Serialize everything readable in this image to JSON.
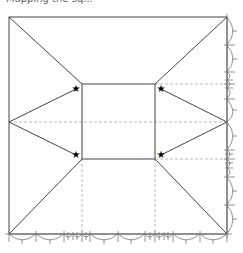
{
  "caption": "Mapping the sq...",
  "diagram": {
    "outer_square": {
      "x1": 9,
      "y1": 17,
      "x2": 227,
      "y2": 234
    },
    "inner_square": {
      "x1": 82,
      "y1": 84,
      "x2": 155,
      "y2": 159
    },
    "center_y": 122,
    "stars": [
      {
        "x": 76,
        "y": 89
      },
      {
        "x": 161,
        "y": 89
      },
      {
        "x": 76,
        "y": 155
      },
      {
        "x": 161,
        "y": 155
      }
    ],
    "colors": {
      "line": "#333333",
      "dashed": "#aaaaaa",
      "ruler": "#666666",
      "star": "#000000"
    }
  }
}
